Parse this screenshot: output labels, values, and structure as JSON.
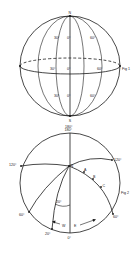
{
  "fig1": {
    "caption": "Fig 1",
    "pole_top": "N",
    "pole_bottom": "S",
    "bottom_label": "180°",
    "labels": {
      "upper_left": "30°",
      "upper_center": "0°",
      "upper_right": "60°",
      "mid_left": "30°",
      "mid_center": "0°",
      "mid_right": "60°",
      "lower_left": "30°",
      "lower_center": "0°",
      "lower_right": "60°"
    }
  },
  "fig2": {
    "caption": "Fig 2",
    "top_label": "180°",
    "bottom_label": "0°",
    "left_label": "120°",
    "right_label": "120°",
    "lower_left_label": "60°",
    "lower_right_label": "60°",
    "angle_label": "20°",
    "bottom_left_label": "20°",
    "pole_label": "N",
    "points": [
      "A",
      "B",
      "C"
    ],
    "west": "W",
    "east": "E"
  },
  "colors": {
    "background": "#ffffff",
    "line": "#1a1a1a"
  }
}
